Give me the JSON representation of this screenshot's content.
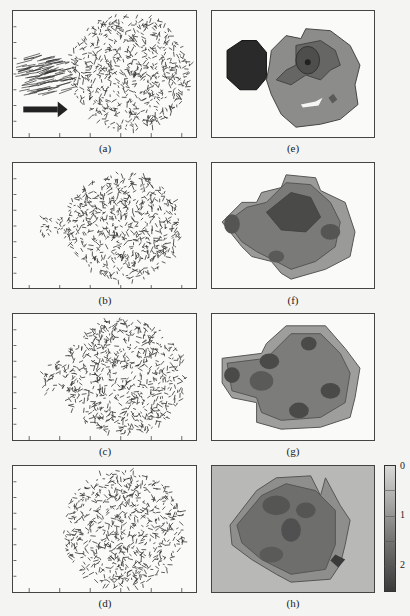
{
  "figure": {
    "panels": [
      {
        "id": "a",
        "label": "(a)",
        "kind": "vector-field",
        "description": "Particle velocity vectors: dense leftward cluster with arrow entering a circular particle cloud"
      },
      {
        "id": "b",
        "label": "(b)",
        "kind": "vector-field"
      },
      {
        "id": "c",
        "label": "(c)",
        "kind": "vector-field"
      },
      {
        "id": "d",
        "label": "(d)",
        "kind": "vector-field"
      },
      {
        "id": "e",
        "label": "(e)",
        "kind": "contour-map"
      },
      {
        "id": "f",
        "label": "(f)",
        "kind": "contour-map"
      },
      {
        "id": "g",
        "label": "(g)",
        "kind": "contour-map"
      },
      {
        "id": "h",
        "label": "(h)",
        "kind": "contour-map"
      }
    ],
    "colorbar": {
      "ticks": [
        "0",
        "1",
        "2"
      ],
      "min": 0,
      "max": 2.5,
      "colors": {
        "low": "#d8d8d6",
        "mid": "#8a8a88",
        "high": "#3a3a3a"
      }
    },
    "arrow_icon": "right-arrow"
  }
}
